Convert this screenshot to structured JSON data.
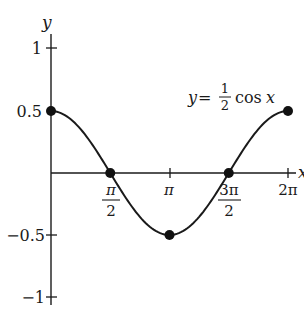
{
  "chart_data": {
    "type": "line",
    "title": "",
    "xlabel": "x",
    "ylabel": "y",
    "function": "y = (1/2) cos x",
    "xlim": [
      0,
      6.2832
    ],
    "ylim": [
      -1,
      1
    ],
    "grid": false,
    "legend": "none",
    "x_ticks": [
      {
        "value": 1.5708,
        "label_num": "π",
        "label_den": "2"
      },
      {
        "value": 3.1416,
        "label": "π"
      },
      {
        "value": 4.7124,
        "label_num": "3π",
        "label_den": "2"
      },
      {
        "value": 6.2832,
        "label": "2π"
      }
    ],
    "y_ticks": [
      {
        "value": 1,
        "label": "1"
      },
      {
        "value": 0.5,
        "label": "0.5"
      },
      {
        "value": -0.5,
        "label": "−0.5"
      },
      {
        "value": -1,
        "label": "−1"
      }
    ],
    "series": [
      {
        "name": "y = 1/2 cos x",
        "x": [
          0,
          0.7854,
          1.5708,
          2.3562,
          3.1416,
          3.927,
          4.7124,
          5.4978,
          6.2832
        ],
        "y": [
          0.5,
          0.354,
          0,
          -0.354,
          -0.5,
          -0.354,
          0,
          0.354,
          0.5
        ]
      }
    ],
    "highlighted_points": [
      {
        "x": 0,
        "y": 0.5
      },
      {
        "x": 1.5708,
        "y": 0
      },
      {
        "x": 3.1416,
        "y": -0.5
      },
      {
        "x": 4.7124,
        "y": 0
      },
      {
        "x": 6.2832,
        "y": 0.5
      }
    ],
    "annotations": [
      {
        "text": "y = 1/2 cos x",
        "position": "upper right near curve end"
      }
    ]
  },
  "labels": {
    "y_axis": "y",
    "x_axis": "x",
    "eq_y": "y",
    "eq_equals": "=",
    "eq_num": "1",
    "eq_den": "2",
    "eq_cos": "cos",
    "eq_x": "x",
    "ytick_1": "1",
    "ytick_05": "0.5",
    "ytick_m05": "−0.5",
    "ytick_m1": "−1",
    "xtick_pi2_num": "π",
    "xtick_pi2_den": "2",
    "xtick_pi": "π",
    "xtick_3pi2_num": "3π",
    "xtick_3pi2_den": "2",
    "xtick_2pi": "2π"
  }
}
